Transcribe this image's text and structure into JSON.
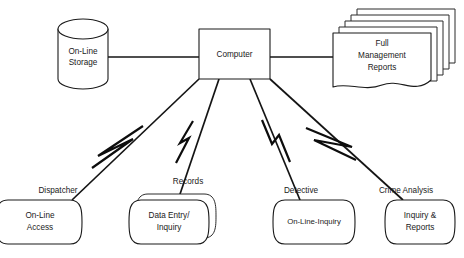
{
  "diagram": {
    "type": "system-architecture-flow",
    "background_color": "#ffffff",
    "line_color": "#141414",
    "text_color": "#1a1a1a",
    "center_node": {
      "id": "computer",
      "label": "Computer",
      "shape": "rectangle"
    },
    "peripherals": [
      {
        "id": "online-storage",
        "label_line1": "On-Line",
        "label_line2": "Storage",
        "shape": "cylinder",
        "position": "left"
      },
      {
        "id": "full-management-reports",
        "label_line1": "Full",
        "label_line2": "Management",
        "label_line3": "Reports",
        "shape": "stacked-document",
        "stack_count": 5,
        "position": "right"
      }
    ],
    "terminals": [
      {
        "id": "dispatcher",
        "edge_label": "Dispatcher",
        "label_line1": "On-Line",
        "label_line2": "Access",
        "shape": "terminal",
        "stacked": false
      },
      {
        "id": "records",
        "edge_label": "Records",
        "label_line1": "Data Entry/",
        "label_line2": "Inquiry",
        "shape": "terminal",
        "stacked": true
      },
      {
        "id": "detective",
        "edge_label": "Detective",
        "label_line1": "On-Line-Inquiry",
        "label_line2": "",
        "shape": "terminal",
        "stacked": false
      },
      {
        "id": "crime-analysis",
        "edge_label": "Crime Analysis",
        "label_line1": "Inquiry &",
        "label_line2": "Reports",
        "shape": "terminal",
        "stacked": false
      }
    ],
    "connectors": [
      {
        "id": "storage-to-computer",
        "style": "straight",
        "break_symbol": false
      },
      {
        "id": "computer-to-reports",
        "style": "straight",
        "break_symbol": false
      },
      {
        "id": "computer-to-dispatcher",
        "style": "diagonal",
        "break_symbol": true
      },
      {
        "id": "computer-to-records",
        "style": "diagonal",
        "break_symbol": true
      },
      {
        "id": "computer-to-detective",
        "style": "diagonal",
        "break_symbol": true
      },
      {
        "id": "computer-to-crime-analysis",
        "style": "diagonal",
        "break_symbol": true
      }
    ]
  }
}
